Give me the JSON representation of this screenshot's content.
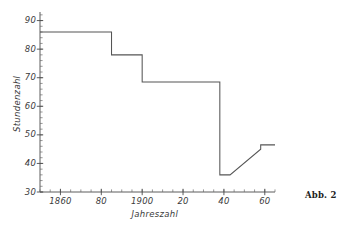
{
  "figure": {
    "caption": "Abb. 2"
  },
  "chart_data": {
    "type": "line",
    "title": "",
    "subtitle": "",
    "xlabel": "Jahreszahl",
    "ylabel": "Stundenzahl",
    "xlim": [
      1850,
      1965
    ],
    "ylim": [
      30,
      93
    ],
    "grid": false,
    "legend": null,
    "legend_position": "none",
    "line_style": "step-then-ramp",
    "x_ticks": [
      1860,
      1880,
      1900,
      1920,
      1940,
      1960
    ],
    "x_tick_labels": [
      "1860",
      "80",
      "1900",
      "20",
      "40",
      "60"
    ],
    "x_minor_tick_step": 5,
    "y_ticks": [
      30,
      40,
      50,
      60,
      70,
      80,
      90
    ],
    "y_tick_labels": [
      "30",
      "40",
      "50",
      "60",
      "70",
      "80",
      "90"
    ],
    "y_minor_tick_step": 2,
    "series": [
      {
        "name": "Wöchentliche Arbeitszeit",
        "x": [
          1850,
          1885,
          1885,
          1900,
          1900,
          1938,
          1938,
          1943,
          1958,
          1958,
          1965
        ],
        "y": [
          86,
          86,
          78,
          78,
          68.5,
          68.5,
          36,
          36,
          45,
          46.5,
          46.5
        ]
      }
    ],
    "annotations": []
  }
}
